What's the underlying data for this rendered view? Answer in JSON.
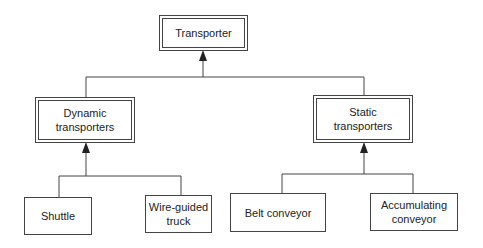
{
  "diagram": {
    "root": {
      "label": "Transporter"
    },
    "categories": [
      {
        "label": "Dynamic\ntransporters",
        "children": [
          {
            "label": "Shuttle"
          },
          {
            "label": "Wire-guided\ntruck"
          }
        ]
      },
      {
        "label": "Static\ntransporters",
        "children": [
          {
            "label": "Belt conveyor"
          },
          {
            "label": "Accumulating\nconveyor"
          }
        ]
      }
    ],
    "edge_style": "arrow-to-parent",
    "colors": {
      "line": "#444444",
      "background": "#ffffff"
    }
  }
}
